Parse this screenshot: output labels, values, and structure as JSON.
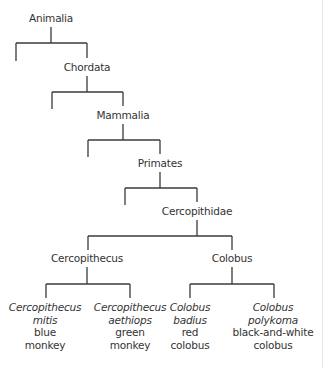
{
  "diagram": {
    "type": "taxonomic-tree",
    "nodes": {
      "animalia": "Animalia",
      "chordata": "Chordata",
      "mammalia": "Mammalia",
      "primates": "Primates",
      "cercopithidae": "Cercopithidae",
      "cercopithecus": "Cercopithecus",
      "colobus": "Colobus"
    },
    "leaves": [
      {
        "genus": "Cercopithecus",
        "species": "mitis",
        "common1": "blue",
        "common2": "monkey"
      },
      {
        "genus": "Cercopithecus",
        "species": "aethiops",
        "common1": "green",
        "common2": "monkey"
      },
      {
        "genus": "Colobus",
        "species": "badius",
        "common1": "red",
        "common2": "colobus"
      },
      {
        "genus": "Colobus",
        "species": "polykoma",
        "common1": "black-and-white",
        "common2": "colobus"
      }
    ],
    "colors": {
      "line": "#3a3a3a",
      "text": "#333333",
      "background": "#ffffff"
    }
  }
}
